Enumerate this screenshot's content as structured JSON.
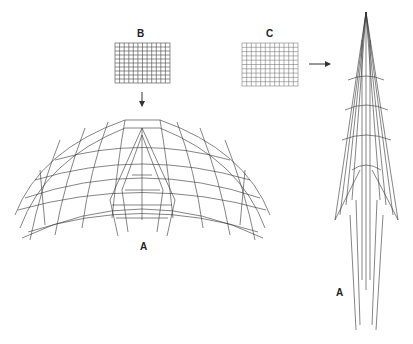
{
  "labels": {
    "grid_b": "B",
    "grid_c": "C",
    "canopy_a": "A",
    "folded_a": "A"
  },
  "figure": {
    "arrows": [
      {
        "from": "grid_b",
        "to": "canopy_a",
        "direction": "down"
      },
      {
        "from": "grid_c",
        "to": "folded_a",
        "direction": "right"
      }
    ]
  },
  "colors": {
    "line": "#333333",
    "background": "#ffffff"
  }
}
